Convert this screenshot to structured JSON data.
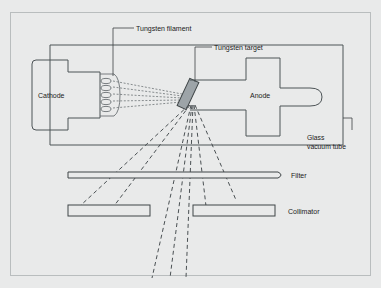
{
  "figure": {
    "title_text": "X-ray tube schematic",
    "background_color": "#e9eaea",
    "line_color": "#4d5457",
    "target_fill_color": "#9da4a8"
  },
  "labels": {
    "tungsten_filament": "Tungsten filament",
    "tungsten_target": "Tungsten target",
    "cathode": "Cathode",
    "anode": "Anode",
    "glass_vacuum_tube_line1": "Glass",
    "glass_vacuum_tube_line2": "vacuum tube",
    "filter": "Filter",
    "collimator": "Collimator"
  },
  "diagram_parts": [
    {
      "name": "glass-vacuum-tube",
      "shape": "rectangle",
      "label": "Glass vacuum tube"
    },
    {
      "name": "cathode",
      "shape": "rounded-rectangle",
      "label": "Cathode"
    },
    {
      "name": "tungsten-filament",
      "shape": "coil",
      "label": "Tungsten filament"
    },
    {
      "name": "tungsten-target",
      "shape": "angled-bar",
      "label": "Tungsten target"
    },
    {
      "name": "anode",
      "shape": "cross-block",
      "label": "Anode"
    },
    {
      "name": "filter",
      "shape": "thin-bar",
      "label": "Filter"
    },
    {
      "name": "collimator-left",
      "shape": "bar",
      "label": "Collimator"
    },
    {
      "name": "collimator-right",
      "shape": "bar",
      "label": "Collimator"
    }
  ],
  "beams": {
    "electron_beam_count": 5,
    "xray_ray_count": 7,
    "xray_rays_through_collimator": 3
  }
}
